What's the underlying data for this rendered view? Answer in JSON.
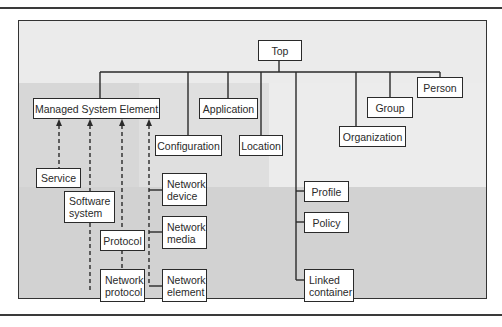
{
  "diagram": {
    "type": "class-hierarchy",
    "root": "Top",
    "nodes": {
      "top": "Top",
      "managed_system_element": "Managed System Element",
      "application": "Application",
      "configuration": "Configuration",
      "location": "Location",
      "organization": "Organization",
      "group": "Group",
      "person": "Person",
      "service": "Service",
      "software_system_1": "Software",
      "software_system_2": "system",
      "protocol": "Protocol",
      "network_protocol_1": "Network",
      "network_protocol_2": "protocol",
      "network_device_1": "Network",
      "network_device_2": "device",
      "network_media_1": "Network",
      "network_media_2": "media",
      "network_element_1": "Network",
      "network_element_2": "element",
      "profile": "Profile",
      "policy": "Policy",
      "linked_container_1": "Linked",
      "linked_container_2": "container"
    },
    "edges": [
      {
        "from": "Top",
        "to": "Managed System Element",
        "style": "solid"
      },
      {
        "from": "Top",
        "to": "Configuration",
        "style": "solid"
      },
      {
        "from": "Top",
        "to": "Application",
        "style": "solid"
      },
      {
        "from": "Top",
        "to": "Location",
        "style": "solid"
      },
      {
        "from": "Top",
        "to": "Organization",
        "style": "solid"
      },
      {
        "from": "Top",
        "to": "Group",
        "style": "solid"
      },
      {
        "from": "Top",
        "to": "Person",
        "style": "solid"
      },
      {
        "from": "Top",
        "to": "Profile",
        "style": "solid"
      },
      {
        "from": "Top",
        "to": "Policy",
        "style": "solid"
      },
      {
        "from": "Top",
        "to": "Linked container",
        "style": "solid"
      },
      {
        "from": "Service",
        "to": "Managed System Element",
        "style": "dashed-arrow"
      },
      {
        "from": "Software system",
        "to": "Managed System Element",
        "style": "dashed-arrow"
      },
      {
        "from": "Protocol",
        "to": "Managed System Element",
        "style": "dashed-arrow"
      },
      {
        "from": "Network protocol",
        "to": "Protocol",
        "style": "dashed"
      },
      {
        "from": "Network device",
        "to": "Managed System Element",
        "style": "dashed-arrow"
      },
      {
        "from": "Network media",
        "to": "Managed System Element",
        "style": "dashed-arrow"
      },
      {
        "from": "Network element",
        "to": "Managed System Element",
        "style": "dashed-arrow"
      }
    ]
  }
}
